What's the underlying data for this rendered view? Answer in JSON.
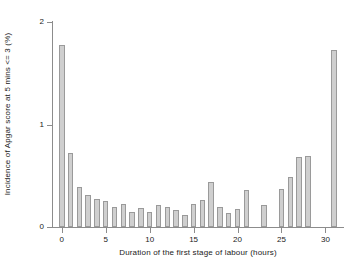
{
  "chart_data": {
    "type": "bar",
    "title": "",
    "subtitle": "",
    "xlabel": "Duration of the first stage of labour (hours)",
    "ylabel": "Incidence of Apgar score at 5 mins <= 3 (%)",
    "xlim": [
      -1,
      32
    ],
    "ylim": [
      0,
      2
    ],
    "grid": false,
    "legend": null,
    "xticks": [
      0,
      5,
      10,
      15,
      20,
      25,
      30
    ],
    "xtick_labels": [
      "0",
      "5",
      "10",
      "15",
      "20",
      "25",
      "30"
    ],
    "yticks": [
      0,
      1,
      2
    ],
    "ytick_labels": [
      "0",
      "1",
      "2"
    ],
    "bar_fill_color": "#cfcfcf",
    "bar_edge_color": "#9a9a9a",
    "axis_color": "#8c8c8c",
    "background_color": "#ffffff",
    "categories": [
      0,
      1,
      2,
      3,
      4,
      5,
      6,
      7,
      8,
      9,
      10,
      11,
      12,
      13,
      14,
      15,
      16,
      17,
      18,
      19,
      20,
      21,
      22,
      23,
      24,
      25,
      26,
      27,
      28,
      29,
      30,
      31
    ],
    "values": [
      1.78,
      0.72,
      0.39,
      0.31,
      0.27,
      0.25,
      0.2,
      0.22,
      0.15,
      0.19,
      0.15,
      0.21,
      0.2,
      0.17,
      0.12,
      0.22,
      0.26,
      0.44,
      0.2,
      0.14,
      0.18,
      0.36,
      0.0,
      0.21,
      0.0,
      0.37,
      0.49,
      0.68,
      0.69,
      0.0,
      0.0,
      1.73
    ]
  }
}
